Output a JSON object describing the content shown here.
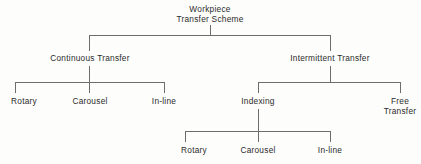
{
  "diagram": {
    "type": "tree",
    "title": "Workpiece Transfer Scheme",
    "orientation": "top-down",
    "colors": {
      "background": "#fdfdfb",
      "connector": "#6d6d6d",
      "text": "#2b2b2b"
    },
    "levels": [
      {
        "level": 1,
        "nodes": [
          {
            "id": "root",
            "line1": "Workpiece",
            "line2": "Transfer Scheme"
          }
        ]
      },
      {
        "level": 2,
        "nodes": [
          {
            "id": "continuous",
            "line1": "Continuous Transfer"
          },
          {
            "id": "intermittent",
            "line1": "Intermittent Transfer"
          }
        ]
      },
      {
        "level": 3,
        "nodes": [
          {
            "id": "cont-rotary",
            "line1": "Rotary"
          },
          {
            "id": "cont-carousel",
            "line1": "Carousel"
          },
          {
            "id": "cont-inline",
            "line1": "In-line"
          },
          {
            "id": "indexing",
            "line1": "Indexing"
          },
          {
            "id": "free-transfer",
            "line1": "Free",
            "line2": "Transfer"
          }
        ]
      },
      {
        "level": 4,
        "nodes": [
          {
            "id": "idx-rotary",
            "line1": "Rotary"
          },
          {
            "id": "idx-carousel",
            "line1": "Carousel"
          },
          {
            "id": "idx-inline",
            "line1": "In-line"
          }
        ]
      }
    ]
  }
}
